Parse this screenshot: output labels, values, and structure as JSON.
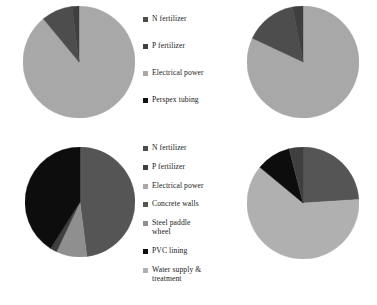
{
  "figure": {
    "background": "#ffffff",
    "palette": {
      "n_fertilizer": "#4d4d4d",
      "p_fertilizer": "#3f3f3f",
      "electrical_power": "#a8a8a8",
      "perspex_tubing": "#111111",
      "concrete_walls": "#555555",
      "steel_paddle_wheel": "#8f8f8f",
      "pvc_lining": "#0d0d0d",
      "water_supply_treatment": "#b0b0b0"
    }
  },
  "legend_top": {
    "items": [
      {
        "label": "N fertilizer",
        "color": "#4d4d4d",
        "swatch": "square-swatch"
      },
      {
        "label": "P fertilizer",
        "color": "#3f3f3f",
        "swatch": "square-swatch"
      },
      {
        "label": "Electrical power",
        "color": "#a8a8a8",
        "swatch": "square-swatch"
      },
      {
        "label": "Perspex tubing",
        "color": "#111111",
        "swatch": "square-swatch"
      }
    ]
  },
  "legend_bottom": {
    "items": [
      {
        "label": "N fertilizer",
        "color": "#4d4d4d",
        "swatch": "square-swatch"
      },
      {
        "label": "P fertilizer",
        "color": "#3f3f3f",
        "swatch": "square-swatch"
      },
      {
        "label": "Electrical power",
        "color": "#a8a8a8",
        "swatch": "square-swatch"
      },
      {
        "label": "Concrete walls",
        "color": "#555555",
        "swatch": "square-swatch"
      },
      {
        "label": "Steel paddle\nwheel",
        "color": "#8f8f8f",
        "swatch": "square-swatch"
      },
      {
        "label": "PVC lining",
        "color": "#0d0d0d",
        "swatch": "square-swatch"
      },
      {
        "label": "Water supply &\ntreatment",
        "color": "#b0b0b0",
        "swatch": "square-swatch"
      }
    ]
  },
  "chart_data": [
    {
      "id": "pie-top-left",
      "type": "pie",
      "title": "",
      "radius": 56,
      "start_angle": 0,
      "direction": "clockwise",
      "labels": [
        "Electrical power",
        "N fertilizer",
        "P fertilizer"
      ],
      "values": [
        89,
        9,
        2
      ],
      "colors": [
        "#a8a8a8",
        "#4d4d4d",
        "#3f3f3f"
      ],
      "legend": "legend_top"
    },
    {
      "id": "pie-top-right",
      "type": "pie",
      "title": "",
      "radius": 56,
      "start_angle": 0,
      "direction": "clockwise",
      "labels": [
        "Electrical power",
        "N fertilizer",
        "P fertilizer"
      ],
      "values": [
        82,
        15,
        3
      ],
      "colors": [
        "#a8a8a8",
        "#4d4d4d",
        "#3f3f3f"
      ],
      "legend": "legend_top"
    },
    {
      "id": "pie-bottom-left",
      "type": "pie",
      "title": "",
      "radius": 55,
      "start_angle": 0,
      "direction": "clockwise",
      "labels": [
        "Concrete walls",
        "Steel paddle wheel",
        "N fertilizer",
        "PVC lining"
      ],
      "values": [
        48,
        9,
        2,
        41
      ],
      "colors": [
        "#555555",
        "#8f8f8f",
        "#3f3f3f",
        "#0d0d0d"
      ],
      "legend": "legend_bottom"
    },
    {
      "id": "pie-bottom-right",
      "type": "pie",
      "title": "",
      "radius": 56,
      "start_angle": 0,
      "direction": "clockwise",
      "labels": [
        "Concrete walls",
        "Water supply & treatment",
        "PVC lining",
        "N fertilizer"
      ],
      "values": [
        24,
        62,
        10,
        4
      ],
      "colors": [
        "#555555",
        "#b0b0b0",
        "#0d0d0d",
        "#3f3f3f"
      ],
      "legend": "legend_bottom"
    }
  ]
}
